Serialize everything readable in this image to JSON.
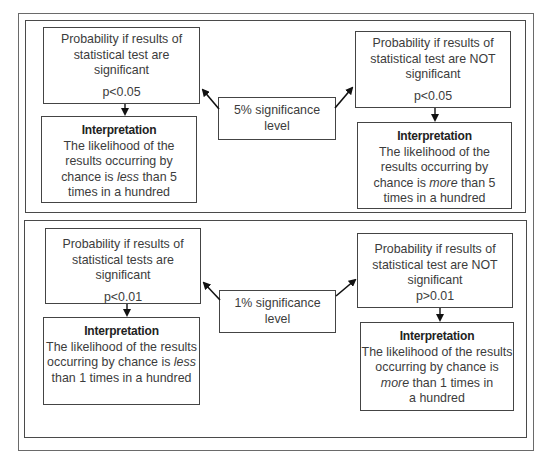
{
  "panels": [
    {
      "level_label": "5% significance level",
      "level_line1": "5% significance",
      "level_line2": "level",
      "significant": {
        "lines": [
          "Probability if results of",
          "statistical test are",
          "significant"
        ],
        "p_value": "p<0.05"
      },
      "not_significant": {
        "lines": [
          "Probability if results of",
          "statistical test are NOT",
          "significant"
        ],
        "p_value": "p<0.05"
      },
      "interp_significant": {
        "title": "Interpretation",
        "line1": "The likelihood of the",
        "line2": "results occurring by",
        "line3_pre": "chance is ",
        "line3_em": "less",
        "line3_post": " than 5",
        "line4": "times in a hundred"
      },
      "interp_not_significant": {
        "title": "Interpretation",
        "line1": "The likelihood of the",
        "line2": "results occurring by",
        "line3_pre": "chance is ",
        "line3_em": "more",
        "line3_post": " than 5",
        "line4": "times in a hundred"
      }
    },
    {
      "level_label": "1% significance level",
      "level_line1": "1% significance",
      "level_line2": "level",
      "significant": {
        "lines": [
          "Probability if results of",
          "statistical tests are significant"
        ],
        "p_value": "p<0.01"
      },
      "not_significant": {
        "lines": [
          "Probability if results of",
          "statistical test are NOT",
          "significant"
        ],
        "p_value": "p>0.01"
      },
      "interp_significant": {
        "title": "Interpretation",
        "line1": "The likelihood of the results",
        "line2_pre": "occurring by chance is ",
        "line2_em": "less",
        "line3": "than 1 times in a hundred"
      },
      "interp_not_significant": {
        "title": "Interpretation",
        "line1": "The likelihood of the results",
        "line2": "occurring by chance is",
        "line3_em": "more",
        "line3_post": " than 1 times in",
        "line4": "a hundred"
      }
    }
  ],
  "colors": {
    "border": "#444444",
    "text": "#3c3c3c",
    "arrow": "#111111"
  }
}
